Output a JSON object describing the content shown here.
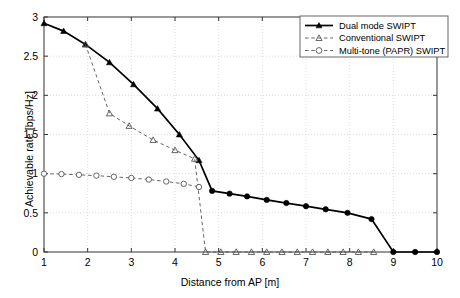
{
  "chart_data": {
    "type": "line",
    "title": "",
    "xlabel": "Distance from AP [m]",
    "ylabel": "Achievable rate [bps/Hz]",
    "xlim": [
      1,
      10
    ],
    "ylim": [
      0,
      3
    ],
    "xticks": [
      "1",
      "2",
      "3",
      "4",
      "5",
      "6",
      "7",
      "8",
      "9",
      "10"
    ],
    "yticks": [
      "0",
      "0.5",
      "1",
      "1.5",
      "2",
      "2.5",
      "3"
    ],
    "grid": true,
    "legend_position": "top-right",
    "series": [
      {
        "name": "Dual mode SWIPT",
        "marker": "filled-triangle-then-filled-circle",
        "linestyle": "solid",
        "color": "#000000",
        "points": [
          [
            1.0,
            2.92
          ],
          [
            1.45,
            2.82
          ],
          [
            1.95,
            2.65
          ],
          [
            2.5,
            2.42
          ],
          [
            3.05,
            2.14
          ],
          [
            3.6,
            1.83
          ],
          [
            4.1,
            1.5
          ],
          [
            4.55,
            1.17
          ],
          [
            4.85,
            0.78
          ],
          [
            5.25,
            0.745
          ],
          [
            5.65,
            0.71
          ],
          [
            6.1,
            0.665
          ],
          [
            6.55,
            0.625
          ],
          [
            7.0,
            0.585
          ],
          [
            7.45,
            0.545
          ],
          [
            7.95,
            0.5
          ],
          [
            8.5,
            0.42
          ],
          [
            9.0,
            0.0
          ],
          [
            9.5,
            0.0
          ],
          [
            10.0,
            0.0
          ]
        ]
      },
      {
        "name": "Conventional SWIPT",
        "marker": "open-triangle",
        "linestyle": "dashed",
        "color": "#555555",
        "points": [
          [
            1.95,
            2.65
          ],
          [
            2.5,
            1.77
          ],
          [
            2.95,
            1.61
          ],
          [
            3.5,
            1.43
          ],
          [
            4.0,
            1.3
          ],
          [
            4.45,
            1.19
          ],
          [
            4.7,
            0.0
          ],
          [
            5.05,
            0.0
          ],
          [
            5.4,
            0.0
          ],
          [
            5.75,
            0.0
          ],
          [
            6.1,
            0.0
          ],
          [
            6.45,
            0.0
          ],
          [
            6.8,
            0.0
          ],
          [
            7.15,
            0.0
          ],
          [
            7.5,
            0.0
          ],
          [
            7.85,
            0.0
          ],
          [
            8.2,
            0.0
          ],
          [
            8.55,
            0.0
          ]
        ]
      },
      {
        "name": "Multi-tone (PAPR) SWIPT",
        "marker": "open-circle",
        "linestyle": "dashed",
        "color": "#555555",
        "points": [
          [
            1.0,
            1.0
          ],
          [
            1.4,
            0.995
          ],
          [
            1.8,
            0.985
          ],
          [
            2.2,
            0.975
          ],
          [
            2.6,
            0.96
          ],
          [
            3.0,
            0.945
          ],
          [
            3.4,
            0.925
          ],
          [
            3.8,
            0.9
          ],
          [
            4.2,
            0.87
          ],
          [
            4.55,
            0.83
          ]
        ]
      }
    ]
  }
}
